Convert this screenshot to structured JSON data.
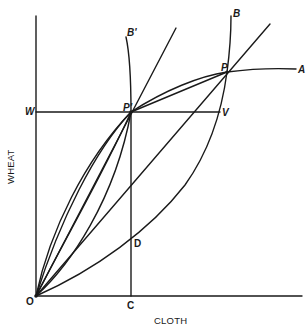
{
  "diagram": {
    "type": "economics-offer-curves",
    "axes": {
      "x_label": "CLOTH",
      "y_label": "WHEAT"
    },
    "point_labels": {
      "origin": "O",
      "A": "A",
      "B": "B",
      "B_prime": "B'",
      "P": "P",
      "P_prime": "P'",
      "W": "W",
      "V": "V",
      "C": "C",
      "D": "D"
    },
    "colors": {
      "line": "#1a1a1a",
      "background": "#ffffff"
    }
  }
}
